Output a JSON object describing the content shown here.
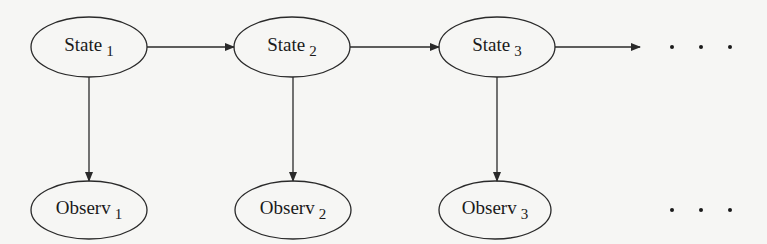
{
  "diagram": {
    "type": "hidden-markov-model",
    "colors": {
      "stroke": "#2a2a2a",
      "background": "#f6f6f4",
      "text": "#1a1a1a"
    },
    "nodes": [
      {
        "id": "state1",
        "name": "State",
        "sub": "1",
        "cx": 89,
        "cy": 47
      },
      {
        "id": "state2",
        "name": "State",
        "sub": "2",
        "cx": 292,
        "cy": 47
      },
      {
        "id": "state3",
        "name": "State",
        "sub": "3",
        "cx": 497,
        "cy": 47
      },
      {
        "id": "observ1",
        "name": "Observ",
        "sub": "1",
        "cx": 89,
        "cy": 210
      },
      {
        "id": "observ2",
        "name": "Observ",
        "sub": "2",
        "cx": 293,
        "cy": 210
      },
      {
        "id": "observ3",
        "name": "Observ",
        "sub": "3",
        "cx": 495,
        "cy": 210
      }
    ],
    "edges": [
      {
        "from": "state1",
        "to": "state2"
      },
      {
        "from": "state2",
        "to": "state3"
      },
      {
        "from": "state3",
        "to": "continuation"
      },
      {
        "from": "state1",
        "to": "observ1"
      },
      {
        "from": "state2",
        "to": "observ2"
      },
      {
        "from": "state3",
        "to": "observ3"
      }
    ],
    "ellipsis_top": "• • •",
    "ellipsis_bottom": "• • •"
  }
}
